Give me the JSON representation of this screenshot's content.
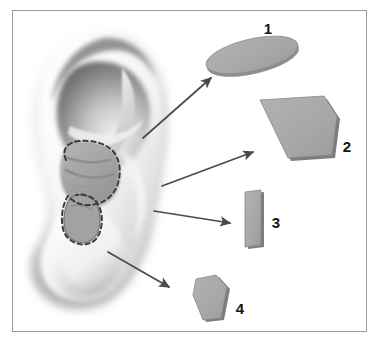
{
  "figure": {
    "background_color": "#ffffff",
    "frame": {
      "name": "figure-border",
      "x": 12,
      "y": 10,
      "width": 355,
      "height": 322,
      "stroke_color": "#9a9a9a",
      "fill_color": "#ffffff"
    },
    "ear": {
      "name": "ear-illustration",
      "description": "Grayscale shaded right ear, helix, antihelix, concha, tragus and lobule",
      "skin_light": "#fdfdfd",
      "skin_mid": "#bfbfbf",
      "skin_shadow": "#6e6e6e",
      "concha_fill": "#a6a6a6",
      "dashed_outline_color": "#3c3c3c"
    },
    "shapes": [
      {
        "id": "shape-1",
        "label": "1",
        "kind": "ellipse-disc",
        "fill": "#a9a9a9",
        "edge": "#6f6f6f",
        "label_x": 268,
        "label_y": 33
      },
      {
        "id": "shape-2",
        "label": "2",
        "kind": "pentagon-plate",
        "fill": "#a9a9a9",
        "edge": "#6f6f6f",
        "label_x": 344,
        "label_y": 151
      },
      {
        "id": "shape-3",
        "label": "3",
        "kind": "narrow-strip",
        "fill": "#a9a9a9",
        "edge": "#6f6f6f",
        "label_x": 274,
        "label_y": 227
      },
      {
        "id": "shape-4",
        "label": "4",
        "kind": "coffin-polygon",
        "fill": "#a9a9a9",
        "edge": "#6f6f6f",
        "label_x": 238,
        "label_y": 313
      }
    ],
    "arrows": [
      {
        "id": "arrow-1",
        "from_label": "ear-antihelix",
        "to_label": "shape-1",
        "x1": 143,
        "y1": 138,
        "x2": 214,
        "y2": 76,
        "color": "#4a4a4a"
      },
      {
        "id": "arrow-2",
        "from_label": "ear-concha",
        "to_label": "shape-2",
        "x1": 162,
        "y1": 186,
        "x2": 256,
        "y2": 151,
        "color": "#4a4a4a"
      },
      {
        "id": "arrow-3",
        "from_label": "ear-tragus",
        "to_label": "shape-3",
        "x1": 154,
        "y1": 211,
        "x2": 233,
        "y2": 223,
        "color": "#4a4a4a"
      },
      {
        "id": "arrow-4",
        "from_label": "ear-lobule",
        "to_label": "shape-4",
        "x1": 108,
        "y1": 252,
        "x2": 172,
        "y2": 289,
        "color": "#4a4a4a"
      }
    ]
  }
}
